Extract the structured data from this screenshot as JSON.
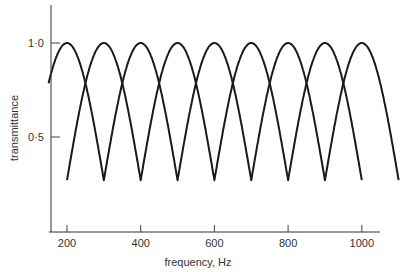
{
  "chart_data": {
    "type": "line",
    "title": "",
    "xlabel": "frequency, Hz",
    "ylabel": "transmittance",
    "xlim": [
      150,
      1050
    ],
    "ylim": [
      0.0,
      1.2
    ],
    "x_ticks": [
      {
        "value": 200,
        "label": "200"
      },
      {
        "value": 400,
        "label": "400"
      },
      {
        "value": 600,
        "label": "600"
      },
      {
        "value": 800,
        "label": "800"
      },
      {
        "value": 1000,
        "label": "1000"
      }
    ],
    "y_ticks": [
      {
        "value": 1.0,
        "label": "1·0"
      },
      {
        "value": 0.5,
        "label": "0·5"
      }
    ],
    "grid": false,
    "legend": null,
    "peak_value": 1.0,
    "trough_value": 0.27,
    "series": [
      {
        "name": "filter A",
        "description": "comb response with maxima at 200, 400, 600, 800, 1000 Hz",
        "range": [
          150,
          1100
        ],
        "peaks": [
          200,
          400,
          600,
          800,
          1000
        ],
        "troughs": [
          300,
          500,
          700,
          900,
          1100
        ],
        "x": [
          150,
          200,
          250,
          300,
          350,
          400,
          450,
          500,
          550,
          600,
          650,
          700,
          750,
          800,
          850,
          900,
          950,
          1000,
          1050,
          1100
        ],
        "values": [
          0.79,
          1.0,
          0.79,
          0.27,
          0.79,
          1.0,
          0.79,
          0.27,
          0.79,
          1.0,
          0.79,
          0.27,
          0.79,
          1.0,
          0.79,
          0.27,
          0.79,
          1.0,
          0.79,
          0.27
        ]
      },
      {
        "name": "filter B",
        "description": "comb response with maxima at 300, 500, 700, 900 Hz",
        "range": [
          200,
          1000
        ],
        "peaks": [
          300,
          500,
          700,
          900
        ],
        "troughs": [
          200,
          400,
          600,
          800,
          1000
        ],
        "x": [
          200,
          250,
          300,
          350,
          400,
          450,
          500,
          550,
          600,
          650,
          700,
          750,
          800,
          850,
          900,
          950,
          1000
        ],
        "values": [
          0.27,
          0.79,
          1.0,
          0.79,
          0.27,
          0.79,
          1.0,
          0.79,
          0.27,
          0.79,
          1.0,
          0.79,
          0.27,
          0.79,
          1.0,
          0.79,
          0.27
        ]
      }
    ]
  },
  "layout": {
    "plot": {
      "x0": 51,
      "y_axis_top": 5,
      "x_axis_y": 232,
      "x_axis_end": 380
    },
    "x_map": {
      "f_ref": 200,
      "px_ref": 67,
      "px_per_hz": 0.3685
    },
    "y_map": {
      "v_ref": 1.0,
      "px_ref": 43,
      "px_per_unit": 188
    },
    "colors": {
      "curve": "#1a1a1a",
      "axis": "#333333",
      "text": "#333333",
      "background": "#ffffff"
    }
  }
}
